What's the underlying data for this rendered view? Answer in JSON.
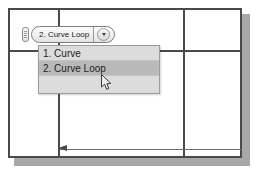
{
  "app": {
    "title": "CAD sketch canvas with open selection dropdown"
  },
  "combo": {
    "grip_icon": "drag-grip-icon",
    "selected_label": "2. Curve Loop",
    "arrow_icon": "chevron-down-icon"
  },
  "dropdown": {
    "open": true,
    "items": [
      {
        "label": "1. Curve",
        "state": "normal"
      },
      {
        "label": "2. Curve Loop",
        "state": "selected"
      }
    ]
  },
  "canvas": {
    "gridlines": {
      "vertical": [
        48,
        173
      ],
      "horizontal": [
        40
      ]
    },
    "dimension_line": {
      "arrow_icon": "dimension-arrow-left-icon",
      "label": ""
    }
  },
  "cursor": {
    "icon": "mouse-arrow-cursor",
    "x": 101,
    "y": 74
  },
  "colors": {
    "frame_stroke": "#4a4a4a",
    "shadow": "#a8a8a8",
    "dropdown_bg": "#dcdcdc",
    "dropdown_selected_bg": "#b9b9b9",
    "canvas_bg": "#ffffff"
  }
}
